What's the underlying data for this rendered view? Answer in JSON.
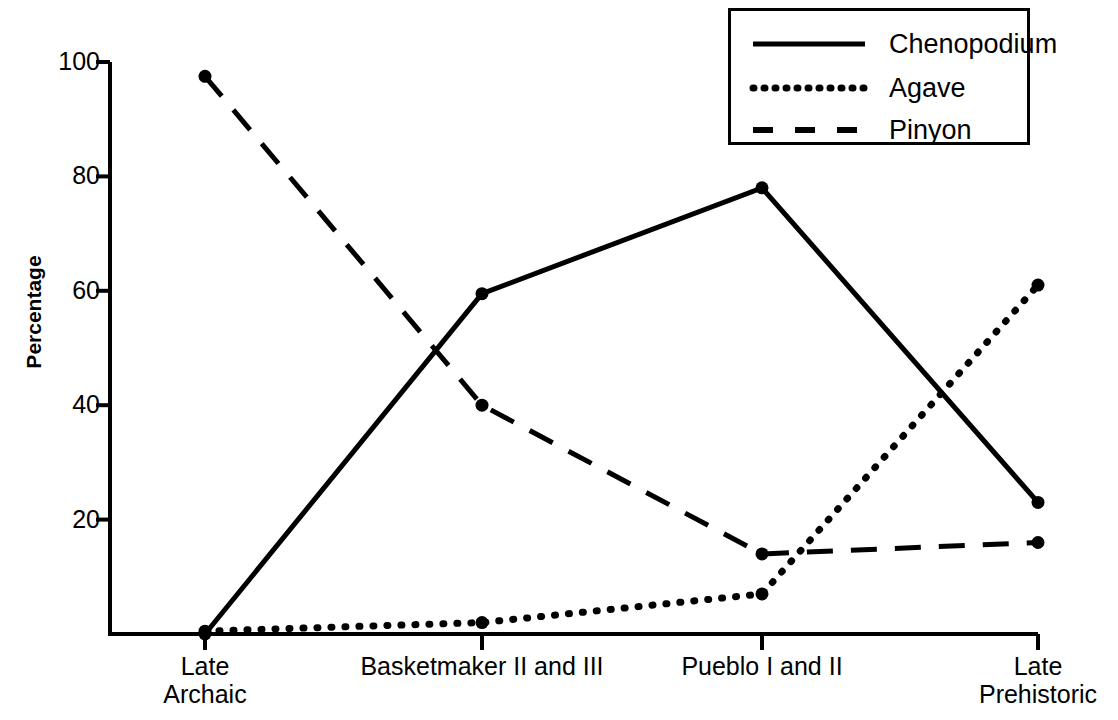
{
  "chart_data": {
    "type": "line",
    "title": "",
    "subtitle": "",
    "xlabel": "",
    "ylabel": "Percentage",
    "categories": [
      "Late\nArchaic",
      "Basketmaker II and III",
      "Pueblo I and II",
      "Late\nPrehistoric"
    ],
    "category_lines": [
      [
        "Late",
        "Archaic"
      ],
      [
        "Basketmaker II and III"
      ],
      [
        "Pueblo I and II"
      ],
      [
        "Late",
        "Prehistoric"
      ]
    ],
    "ylim": [
      0,
      100
    ],
    "yticks": [
      20,
      40,
      60,
      80,
      100
    ],
    "ytick_labels": [
      "20",
      "40",
      "60",
      "80",
      "100"
    ],
    "grid": false,
    "legend_position": "top-right",
    "series": [
      {
        "name": "Chenopodium",
        "style": "solid",
        "marker": "circle",
        "color": "#000000",
        "values": [
          0,
          59.5,
          78,
          23
        ]
      },
      {
        "name": "Agave",
        "style": "dotted",
        "marker": "circle",
        "color": "#000000",
        "values": [
          0.5,
          2,
          7,
          61
        ]
      },
      {
        "name": "Pinyon",
        "style": "dashed",
        "marker": "circle",
        "color": "#000000",
        "values": [
          97.5,
          40,
          14,
          16
        ]
      }
    ]
  },
  "legend": {
    "entries": [
      {
        "label": "Chenopodium",
        "style": "solid"
      },
      {
        "label": "Agave",
        "style": "dotted"
      },
      {
        "label": "Pinyon",
        "style": "dashed"
      }
    ]
  },
  "colors": {
    "ink": "#000000",
    "background": "#ffffff"
  }
}
